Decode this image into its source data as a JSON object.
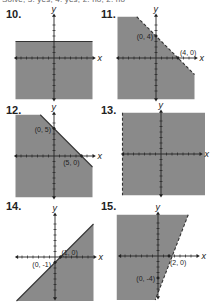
{
  "header_partial_text": "Solve, 3. yes, 4. yes, 2. no, 2. no",
  "colors": {
    "shade": "#8a8a8a",
    "axis": "#222222",
    "boundary": "#333333"
  },
  "axis_labels": {
    "x": "x",
    "y": "y"
  },
  "graphs": [
    {
      "number": "10.",
      "inequality_boundary": "y = 3",
      "boundary_style": "solid",
      "shade": "below",
      "points": []
    },
    {
      "number": "11.",
      "inequality_boundary": "x + y = 4",
      "boundary_style": "dashed",
      "shade": "below",
      "points": [
        {
          "label": "(0, 4)",
          "x": 0,
          "y": 4
        },
        {
          "label": "(4, 0)",
          "x": 4,
          "y": 0
        }
      ]
    },
    {
      "number": "12.",
      "inequality_boundary": "x + y = 5",
      "boundary_style": "solid",
      "shade": "below",
      "points": [
        {
          "label": "(0, 5)",
          "x": 0,
          "y": 5
        },
        {
          "label": "(5, 0)",
          "x": 5,
          "y": 0
        }
      ]
    },
    {
      "number": "13.",
      "inequality_boundary": "x = -2",
      "boundary_style": "dashed",
      "shade": "right",
      "points": []
    },
    {
      "number": "14.",
      "inequality_boundary": "y = x - 1",
      "boundary_style": "solid",
      "shade": "below",
      "points": [
        {
          "label": "(1, 0)",
          "x": 1,
          "y": 0
        },
        {
          "label": "(0, -1)",
          "x": 0,
          "y": -1
        }
      ]
    },
    {
      "number": "15.",
      "inequality_boundary": "y = 2x - 4",
      "boundary_style": "dashed",
      "shade": "left",
      "points": [
        {
          "label": "(2, 0)",
          "x": 2,
          "y": 0
        },
        {
          "label": "(0, -4)",
          "x": 0,
          "y": -4
        }
      ]
    }
  ]
}
